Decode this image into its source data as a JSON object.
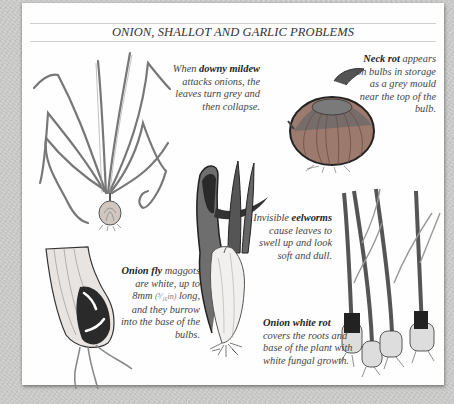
{
  "page": {
    "title": "ONION, SHALLOT AND GARLIC PROBLEMS",
    "background_color": "#c9c9c7",
    "card_color": "#fefefe",
    "text_color": "#444444"
  },
  "captions": {
    "downy_mildew": {
      "pre": "When ",
      "bold": "downy mildew",
      "post": " attacks onions, the leaves turn grey and then collapse."
    },
    "neck_rot": {
      "bold": "Neck rot",
      "post": " appears on bulbs in storage as a grey mould near the top of the bulb."
    },
    "eelworms": {
      "pre": "Invisible ",
      "bold": "eelworms",
      "post": " cause leaves to swell up and look soft and dull."
    },
    "onion_fly": {
      "bold": "Onion fly",
      "post_a": " maggots are white, up to 8mm ",
      "fraction": "(⁵⁄₁₆in)",
      "post_b": " long, and they burrow into the base of the bulbs."
    },
    "white_rot": {
      "bold": "Onion white rot",
      "post": " covers the roots and base of the plant with white fungal growth."
    }
  },
  "illustrations": [
    {
      "name": "downy-mildew-onion-plant",
      "description": "onion plant with drooping collapsed leaves"
    },
    {
      "name": "neck-rot-onion-bulb",
      "description": "onion bulb with grey mould at the neck"
    },
    {
      "name": "eelworm-swollen-onion",
      "description": "swollen distorted onion shoot"
    },
    {
      "name": "onion-fly-damaged-bulb",
      "description": "cut bulb base with white maggots"
    },
    {
      "name": "white-rot-onions",
      "description": "group of onion plants with white fungal growth at roots"
    }
  ]
}
